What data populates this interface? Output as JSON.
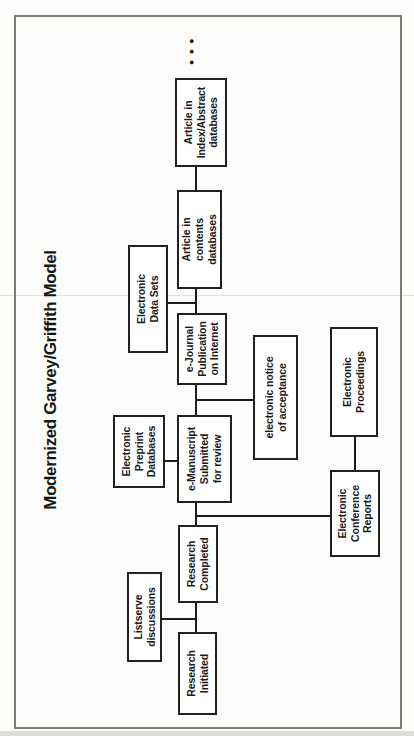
{
  "title": "Modernized Garvey/Griffith Model",
  "ellipsis": "●●●",
  "nodes": {
    "research_initiated": {
      "label": "Research\nInitiated"
    },
    "listserve_discussions": {
      "label": "Listserve\ndiscussions"
    },
    "research_completed": {
      "label": "Research\nCompleted"
    },
    "electronic_preprint_databases": {
      "label": "Electronic\nPreprint\nDatabases"
    },
    "e_manuscript_submitted": {
      "label": "e-Manuscript\nSubmitted\nfor review"
    },
    "electronic_notice_of_acceptance": {
      "label": "electronic notice\nof acceptance"
    },
    "electronic_conference_reports": {
      "label": "Electronic\nConference\nReports"
    },
    "electronic_proceedings": {
      "label": "Electronic\nProceedings"
    },
    "e_journal_publication": {
      "label": "e-Journal\nPublication\non Internet"
    },
    "electronic_data_sets": {
      "label": "Electronic\nData Sets"
    },
    "article_in_contents_databases": {
      "label": "Article in\ncontents\ndatabases"
    },
    "article_in_index_abstract_databases": {
      "label": "Article in\nIndex/Abstract\ndatabases"
    }
  },
  "colors": {
    "box_border": "#212121",
    "connector": "#1b1b1b",
    "frame_border": "#7d7d7a",
    "page_background": "#fcfcfa",
    "scan_artifact_line": "#e4e4df"
  }
}
